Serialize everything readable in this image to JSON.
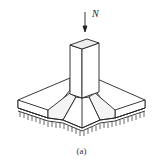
{
  "figure": {
    "load_label": "N",
    "caption": "(a)",
    "colors": {
      "line": "#222222",
      "background": "#ffffff"
    }
  }
}
